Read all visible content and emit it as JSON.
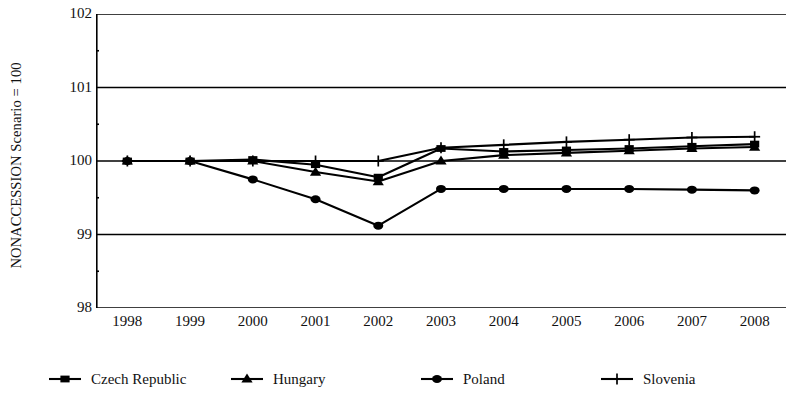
{
  "chart_data": {
    "type": "line",
    "title": "",
    "xlabel": "",
    "ylabel": "NONACCESSION Scenario = 100",
    "categories": [
      "1998",
      "1999",
      "2000",
      "2001",
      "2002",
      "2003",
      "2004",
      "2005",
      "2006",
      "2007",
      "2008"
    ],
    "x": [
      1998,
      1999,
      2000,
      2001,
      2002,
      2003,
      2004,
      2005,
      2006,
      2007,
      2008
    ],
    "xlim": [
      1997.5,
      2008.5
    ],
    "ylim": [
      98,
      102
    ],
    "yticks": [
      98,
      99,
      100,
      101,
      102
    ],
    "ytick_labels": [
      "98",
      "99",
      "100",
      "101",
      "102"
    ],
    "yminorticks": [
      98.5,
      99.5,
      100.5,
      101.5
    ],
    "grid": "horizontal",
    "legend_position": "bottom",
    "series": [
      {
        "name": "Czech Republic",
        "marker": "square",
        "values": [
          100.0,
          100.0,
          100.02,
          99.95,
          99.78,
          100.17,
          100.13,
          100.15,
          100.17,
          100.2,
          100.23
        ]
      },
      {
        "name": "Hungary",
        "marker": "triangle",
        "values": [
          100.0,
          100.0,
          100.0,
          99.85,
          99.72,
          100.0,
          100.08,
          100.11,
          100.14,
          100.17,
          100.19
        ]
      },
      {
        "name": "Poland",
        "marker": "circle",
        "values": [
          100.0,
          100.0,
          99.75,
          99.48,
          99.12,
          99.62,
          99.62,
          99.62,
          99.62,
          99.61,
          99.6
        ]
      },
      {
        "name": "Slovenia",
        "marker": "plus",
        "values": [
          100.0,
          100.0,
          100.0,
          100.0,
          100.0,
          100.18,
          100.22,
          100.26,
          100.29,
          100.32,
          100.33
        ]
      }
    ]
  },
  "legend": {
    "items": [
      {
        "label": "Czech Republic",
        "marker": "square"
      },
      {
        "label": "Hungary",
        "marker": "triangle"
      },
      {
        "label": "Poland",
        "marker": "circle"
      },
      {
        "label": "Slovenia",
        "marker": "plus"
      }
    ]
  }
}
